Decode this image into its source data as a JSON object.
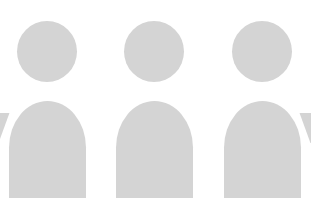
{
  "illustration": {
    "subject": "group of three person silhouettes",
    "fill_color": "#d4d4d4",
    "background_color": "#ffffff",
    "figures": [
      {
        "id": "person-1",
        "head": {
          "left": 17,
          "top": 21
        },
        "body": {
          "left": 9,
          "top": 101
        }
      },
      {
        "id": "person-2",
        "head": {
          "left": 124,
          "top": 21
        },
        "body": {
          "left": 116,
          "top": 101
        }
      },
      {
        "id": "person-3",
        "head": {
          "left": 232,
          "top": 21
        },
        "body": {
          "left": 224,
          "top": 101
        }
      }
    ]
  }
}
